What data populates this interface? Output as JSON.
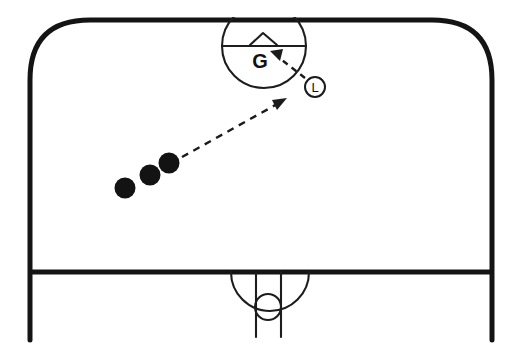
{
  "diagram": {
    "type": "sports-play-diagram",
    "background_color": "#ffffff",
    "line_color": "#141414",
    "accent_color": "#1b1b1b",
    "court": {
      "name": "court-outline",
      "shape": "rounded-rectangle-open-bottom",
      "corner_radius": 60,
      "left_x": 30,
      "right_x": 492,
      "top_y": 20,
      "goal_line_y": 272,
      "sideline_bottom_y": 340
    },
    "top_goal_area": {
      "name": "goal-circle-top",
      "center_x": 264,
      "center_y": 46,
      "radius": 42,
      "divider_line_y": 46,
      "net_chevron": {
        "left_x": 250,
        "apex_x": 263,
        "right_x": 277,
        "base_y": 45,
        "apex_y": 33
      }
    },
    "bottom_goal_area": {
      "name": "goal-area-bottom",
      "arc_center_x": 270,
      "arc_center_y": 272,
      "arc_radius": 39,
      "post_left_x": 256,
      "post_right_x": 281,
      "post_bottom_y": 337,
      "circle_center_x": 268,
      "circle_center_y": 307,
      "circle_radius": 13
    },
    "balls": [
      {
        "name": "ball-1",
        "cx": 125,
        "cy": 188,
        "r": 10.5
      },
      {
        "name": "ball-2",
        "cx": 150,
        "cy": 175,
        "r": 10.5
      },
      {
        "name": "ball-3",
        "cx": 169,
        "cy": 163,
        "r": 10.5
      }
    ],
    "arrows": [
      {
        "name": "pass-arrow-long",
        "style": "dashed",
        "from_x": 182,
        "from_y": 157,
        "to_x": 284,
        "to_y": 100,
        "head_angle_deg": -29
      },
      {
        "name": "shot-arrow-short",
        "style": "dashed",
        "from_x": 305,
        "from_y": 78,
        "to_x": 272,
        "to_y": 52,
        "head_angle_deg": -142
      }
    ],
    "labels": {
      "goalkeeper": {
        "name": "goalkeeper-label",
        "text": "G",
        "x": 260,
        "y": 66
      },
      "left_wing": {
        "name": "left-wing-token",
        "text": "L",
        "x": 315,
        "y": 87,
        "radius": 10
      }
    }
  }
}
